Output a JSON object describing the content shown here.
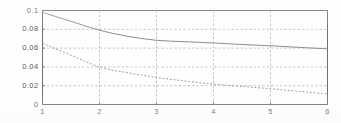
{
  "figure": {
    "background_color": "#fefefe",
    "axis_color": "#6e6e73",
    "grid_color": "#9a9aa0",
    "tick_text_color": "#55555a"
  },
  "chart_data": {
    "type": "line",
    "title": "",
    "xlabel": "",
    "ylabel": "",
    "xlim": [
      1,
      6
    ],
    "ylim": [
      0,
      0.1
    ],
    "grid": true,
    "legend": "none",
    "x_ticks": [
      "1",
      "2",
      "3",
      "4",
      "5",
      "6"
    ],
    "x_tick_values": [
      1,
      2,
      3,
      4,
      5,
      6
    ],
    "y_ticks": [
      "0",
      "0.02",
      "0.04",
      "0.06",
      "0.08",
      "0.1"
    ],
    "y_tick_values": [
      0,
      0.02,
      0.04,
      0.06,
      0.08,
      0.1
    ],
    "x": [
      1,
      1.5,
      2,
      2.5,
      3,
      3.5,
      4,
      4.5,
      5,
      5.5,
      6
    ],
    "series": [
      {
        "name": "solid-curve",
        "style": "solid",
        "color": "#7d7d82",
        "values": [
          0.098,
          0.0885,
          0.079,
          0.0725,
          0.0683,
          0.0668,
          0.0655,
          0.0638,
          0.0625,
          0.0608,
          0.0592
        ]
      },
      {
        "name": "dotted-curve",
        "style": "dotted",
        "color": "#85858a",
        "values": [
          0.065,
          0.0525,
          0.04,
          0.0337,
          0.0288,
          0.025,
          0.0218,
          0.0192,
          0.0168,
          0.014,
          0.0112
        ]
      }
    ]
  }
}
